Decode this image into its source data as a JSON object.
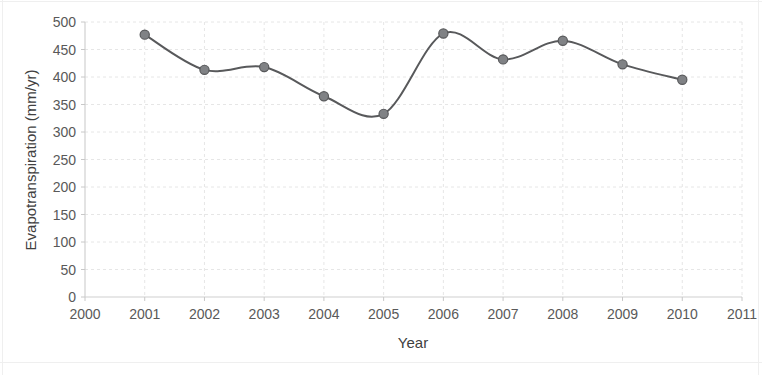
{
  "chart_data": {
    "type": "line",
    "title": "",
    "xlabel": "Year",
    "ylabel": "Evapotranspiration (mm/yr)",
    "x": [
      2001,
      2002,
      2003,
      2004,
      2005,
      2006,
      2007,
      2008,
      2009,
      2010
    ],
    "values": [
      477,
      413,
      418,
      365,
      333,
      479,
      432,
      466,
      423,
      395
    ],
    "series": [
      {
        "name": "Evapotranspiration",
        "x": [
          2001,
          2002,
          2003,
          2004,
          2005,
          2006,
          2007,
          2008,
          2009,
          2010
        ],
        "values": [
          477,
          413,
          418,
          365,
          333,
          479,
          432,
          466,
          423,
          395
        ]
      }
    ],
    "xlim": [
      2000,
      2011
    ],
    "ylim": [
      0,
      500
    ],
    "x_ticks": [
      2000,
      2001,
      2002,
      2003,
      2004,
      2005,
      2006,
      2007,
      2008,
      2009,
      2010,
      2011
    ],
    "x_tick_labels": [
      "2000",
      "2001",
      "2002",
      "2003",
      "2004",
      "2005",
      "2006",
      "2007",
      "2008",
      "2009",
      "2010",
      "2011"
    ],
    "y_ticks": [
      0,
      50,
      100,
      150,
      200,
      250,
      300,
      350,
      400,
      450,
      500
    ],
    "y_tick_labels": [
      "0",
      "50",
      "100",
      "150",
      "200",
      "250",
      "300",
      "350",
      "400",
      "450",
      "500"
    ],
    "grid": true,
    "grid_axis": "both",
    "legend": false,
    "legend_position": "none",
    "line_color": "#58595b",
    "marker_color": "#808285",
    "marker_shape": "circle",
    "gridline_color": "#e6e6e6",
    "background_color": "#ffffff",
    "annotations": []
  }
}
